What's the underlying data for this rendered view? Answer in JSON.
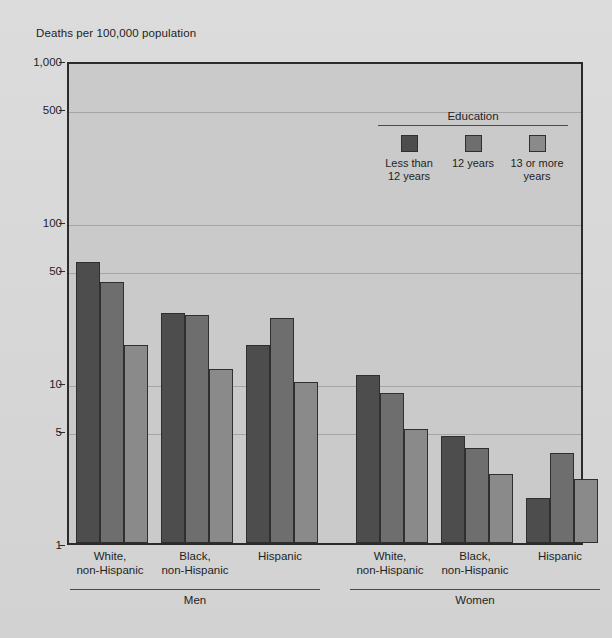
{
  "axis_title": "Deaths per 100,000 population",
  "legend": {
    "title": "Education",
    "items": [
      {
        "label_line1": "Less than",
        "label_line2": "12 years",
        "color": "#4d4d4d"
      },
      {
        "label_line1": "12 years",
        "label_line2": "",
        "color": "#6e6e6e"
      },
      {
        "label_line1": "13 or more",
        "label_line2": "years",
        "color": "#8a8a8a"
      }
    ]
  },
  "sections": [
    {
      "name": "Men"
    },
    {
      "name": "Women"
    }
  ],
  "group_labels": [
    {
      "line1": "White,",
      "line2": "non-Hispanic"
    },
    {
      "line1": "Black,",
      "line2": "non-Hispanic"
    },
    {
      "line1": "Hispanic",
      "line2": ""
    },
    {
      "line1": "White,",
      "line2": "non-Hispanic"
    },
    {
      "line1": "Black,",
      "line2": "non-Hispanic"
    },
    {
      "line1": "Hispanic",
      "line2": ""
    }
  ],
  "y_ticks": [
    {
      "label": "1,000",
      "value": 1000
    },
    {
      "label": "500",
      "value": 500
    },
    {
      "label": "100",
      "value": 100
    },
    {
      "label": "50",
      "value": 50
    },
    {
      "label": "10",
      "value": 10
    },
    {
      "label": "5",
      "value": 5
    },
    {
      "label": "1",
      "value": 1
    }
  ],
  "chart_data": {
    "type": "bar",
    "title": "",
    "xlabel": "",
    "ylabel": "Deaths per 100,000 population",
    "yscale": "log",
    "ylim": [
      1,
      1000
    ],
    "grid": true,
    "legend_position": "inside-top-right",
    "legend_title": "Education",
    "categories": [
      "Men / White, non-Hispanic",
      "Men / Black, non-Hispanic",
      "Men / Hispanic",
      "Women / White, non-Hispanic",
      "Women / Black, non-Hispanic",
      "Women / Hispanic"
    ],
    "series": [
      {
        "name": "Less than 12 years",
        "color": "#4d4d4d",
        "values": [
          56,
          27,
          17,
          11,
          4.6,
          1.9
        ]
      },
      {
        "name": "12 years",
        "color": "#6e6e6e",
        "values": [
          42,
          26,
          25,
          8.5,
          3.9,
          3.6
        ]
      },
      {
        "name": "13 or more years",
        "color": "#8a8a8a",
        "values": [
          17,
          12,
          10,
          5.1,
          2.7,
          2.5
        ]
      }
    ]
  }
}
